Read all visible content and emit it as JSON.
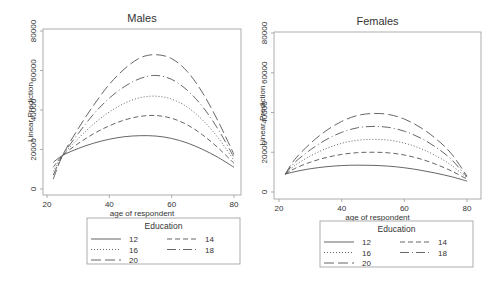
{
  "chart_data": [
    {
      "type": "line",
      "title": "Males",
      "xlabel": "age of respondent",
      "ylabel": "Linear Prediction",
      "xlim": [
        20,
        80
      ],
      "ylim": [
        0,
        80000
      ],
      "xticks": [
        20,
        40,
        60,
        80
      ],
      "yticks": [
        0,
        20000,
        40000,
        60000,
        80000
      ],
      "grid": false,
      "legend": {
        "title": "Education",
        "position": "bottom",
        "entries": [
          "12",
          "14",
          "16",
          "18",
          "20"
        ]
      },
      "x": [
        22,
        25,
        30,
        35,
        40,
        45,
        50,
        55,
        60,
        65,
        70,
        75,
        80
      ],
      "series": [
        {
          "name": "12",
          "style": "solid",
          "values": [
            13500,
            17000,
            20500,
            23200,
            25200,
            26500,
            27000,
            26800,
            25600,
            23300,
            20000,
            15900,
            11000
          ]
        },
        {
          "name": "14",
          "style": "dash",
          "values": [
            11000,
            17000,
            23000,
            28000,
            32000,
            35000,
            36800,
            37200,
            35800,
            32500,
            27300,
            20700,
            13000
          ]
        },
        {
          "name": "16",
          "style": "dot",
          "values": [
            9000,
            17000,
            25500,
            33000,
            39000,
            43500,
            46300,
            47000,
            45500,
            41500,
            34800,
            25700,
            14500
          ]
        },
        {
          "name": "18",
          "style": "longdash-dot",
          "values": [
            7000,
            17000,
            28000,
            38000,
            46000,
            52000,
            56000,
            57500,
            55500,
            50000,
            41500,
            30000,
            16000
          ]
        },
        {
          "name": "20",
          "style": "longdash",
          "values": [
            5000,
            17000,
            30500,
            42500,
            53000,
            61000,
            66500,
            68000,
            66000,
            59500,
            48500,
            34000,
            17500
          ]
        }
      ]
    },
    {
      "type": "line",
      "title": "Females",
      "xlabel": "age of respondent",
      "ylabel": "Linear Prediction",
      "xlim": [
        20,
        80
      ],
      "ylim": [
        0,
        80000
      ],
      "xticks": [
        20,
        40,
        60,
        80
      ],
      "yticks": [
        0,
        20000,
        40000,
        60000,
        80000
      ],
      "grid": false,
      "legend": {
        "title": "Education",
        "position": "bottom",
        "entries": [
          "12",
          "14",
          "16",
          "18",
          "20"
        ]
      },
      "x": [
        22,
        25,
        30,
        35,
        40,
        45,
        50,
        55,
        60,
        65,
        70,
        75,
        80
      ],
      "series": [
        {
          "name": "12",
          "style": "solid",
          "values": [
            9000,
            10200,
            11700,
            12700,
            13300,
            13500,
            13400,
            13000,
            12200,
            11000,
            9500,
            7700,
            5500
          ]
        },
        {
          "name": "14",
          "style": "dash",
          "values": [
            9000,
            11800,
            15000,
            17300,
            18900,
            19800,
            20000,
            19700,
            18600,
            16700,
            14000,
            10600,
            6500
          ]
        },
        {
          "name": "16",
          "style": "dot",
          "values": [
            9000,
            13300,
            18100,
            21800,
            24500,
            26000,
            26500,
            26100,
            24600,
            22000,
            18300,
            13500,
            7000
          ]
        },
        {
          "name": "18",
          "style": "longdash-dot",
          "values": [
            9000,
            14800,
            21200,
            26300,
            30000,
            32300,
            33000,
            32500,
            30600,
            27300,
            22600,
            16400,
            7500
          ]
        },
        {
          "name": "20",
          "style": "longdash",
          "values": [
            9000,
            16300,
            24400,
            30800,
            35500,
            38500,
            39500,
            39000,
            36700,
            32600,
            26900,
            19300,
            8000
          ]
        }
      ]
    }
  ]
}
